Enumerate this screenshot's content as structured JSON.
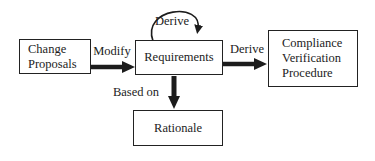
{
  "diagram": {
    "type": "flow-diagram",
    "nodes": {
      "change_proposals": {
        "label": "Change\nProposals"
      },
      "requirements": {
        "label": "Requirements"
      },
      "compliance_verification_procedure": {
        "label": "Compliance\nVerification\nProcedure"
      },
      "rationale": {
        "label": "Rationale"
      }
    },
    "edges": {
      "modify": {
        "label": "Modify",
        "from": "change_proposals",
        "to": "requirements",
        "style": "thick"
      },
      "derive_self_loop": {
        "label": "Derive",
        "from": "requirements",
        "to": "requirements",
        "style": "thin-loop"
      },
      "derive": {
        "label": "Derive",
        "from": "requirements",
        "to": "compliance_verification_procedure",
        "style": "thick"
      },
      "based_on": {
        "label": "Based on",
        "from": "requirements",
        "to": "rationale",
        "style": "thick"
      }
    },
    "colors": {
      "ink": "#1c1c1c",
      "border": "#222222",
      "background": "#ffffff"
    }
  }
}
